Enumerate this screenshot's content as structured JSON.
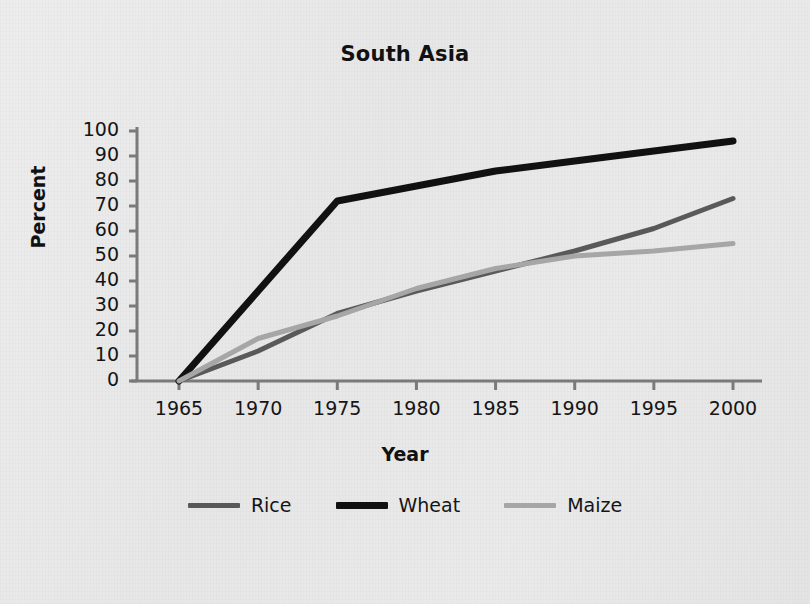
{
  "chart_data": {
    "type": "line",
    "title": "South Asia",
    "xlabel": "Year",
    "ylabel": "Percent",
    "x": [
      1965,
      1970,
      1975,
      1980,
      1985,
      1990,
      1995,
      2000
    ],
    "xlim": [
      1963,
      2001
    ],
    "ylim": [
      0,
      100
    ],
    "xticks": [
      "1965",
      "1970",
      "1975",
      "1980",
      "1985",
      "1990",
      "1995",
      "2000"
    ],
    "yticks": [
      "100",
      "90",
      "80",
      "70",
      "60",
      "50",
      "40",
      "30",
      "20",
      "10",
      "0"
    ],
    "grid": false,
    "legend_position": "bottom",
    "series": [
      {
        "name": "Rice",
        "color": "#595959",
        "width": 5,
        "values": [
          0,
          12,
          27,
          36,
          44,
          52,
          61,
          73
        ]
      },
      {
        "name": "Wheat",
        "color": "#111111",
        "width": 7,
        "values": [
          0,
          36,
          72,
          78,
          84,
          88,
          92,
          96
        ]
      },
      {
        "name": "Maize",
        "color": "#a6a6a6",
        "width": 5,
        "values": [
          0,
          17,
          26,
          37,
          45,
          50,
          52,
          55
        ]
      }
    ]
  },
  "axis": {
    "line_color": "#7a7a7a"
  }
}
